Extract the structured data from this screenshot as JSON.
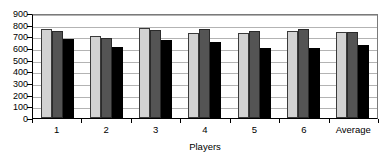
{
  "chart_data": {
    "type": "bar",
    "title": "",
    "subtitle": "",
    "xlabel": "Players",
    "ylabel": "",
    "categories": [
      "1",
      "2",
      "3",
      "4",
      "5",
      "6",
      "Average"
    ],
    "series": [
      {
        "name": "series-1",
        "color": "#d2d2d2",
        "values": [
          760,
          705,
          768,
          730,
          725,
          748,
          738
        ]
      },
      {
        "name": "series-2",
        "color": "#545454",
        "values": [
          745,
          690,
          752,
          765,
          742,
          760,
          740
        ]
      },
      {
        "name": "series-3",
        "color": "#000000",
        "values": [
          680,
          607,
          665,
          652,
          598,
          600,
          630
        ]
      }
    ],
    "ylim": [
      0,
      900
    ],
    "ytick_step": 100,
    "yticks": [
      900,
      800,
      700,
      600,
      500,
      400,
      300,
      200,
      100,
      0
    ],
    "ytick_labels": [
      "900",
      "800",
      "700",
      "600",
      "500",
      "400",
      "300",
      "200",
      "100",
      "0"
    ],
    "grid": true,
    "grid_axis": "y",
    "legend": false,
    "legend_position": "none",
    "plot_background": "#ffffff",
    "gridline_color": "#b3b3b3",
    "axis_color": "#000000"
  }
}
